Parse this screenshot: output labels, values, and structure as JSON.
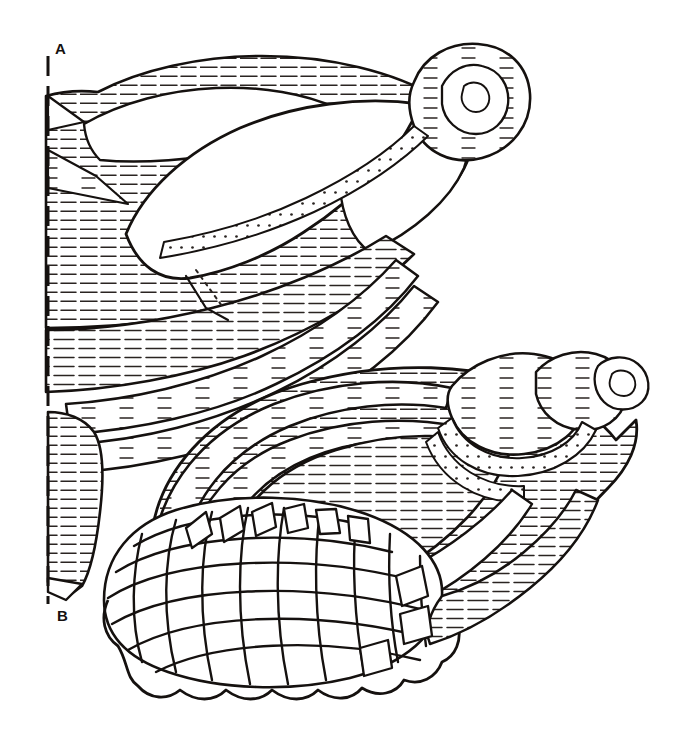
{
  "figure": {
    "background_color": "#ffffff",
    "ink_color": "#15110f",
    "hatch_color": "#2a2421",
    "width": 692,
    "height": 752
  },
  "axis": {
    "name": "reference-axis",
    "orientation": "vertical",
    "style": "dashed",
    "x": 48,
    "y_top": 56,
    "y_bottom": 604,
    "dash_length": 20,
    "gap_length": 10,
    "stroke_width": 3,
    "top_label": "A",
    "bottom_label": "B",
    "top_label_position": {
      "x": 55,
      "y": 41
    },
    "bottom_label_position": {
      "x": 57,
      "y": 608
    }
  },
  "specimens": [
    {
      "id": "upper-shell",
      "name": "upper-shell",
      "label": "A",
      "position": "upper-left",
      "orientation": "apex to upper right, siphonal canal to lower left",
      "apex": {
        "x": 470,
        "y": 78
      },
      "bounds": {
        "x": 40,
        "y": 45,
        "width": 505,
        "height": 545
      },
      "features": [
        "spiral apex with nested whorls",
        "broad body whorl with dense horizontal hatching",
        "two smooth unhatched shoulder panels",
        "long tapering siphonal canal extending to lower left",
        "beaded suture bands",
        "cut-away section along the dashed axis"
      ],
      "hatch_direction": "horizontal",
      "hatch_spacing_px": 9
    },
    {
      "id": "lower-shell",
      "name": "lower-shell",
      "label": "B",
      "position": "lower-right",
      "orientation": "apex to upper right, aperture lip to lower left",
      "apex": {
        "x": 646,
        "y": 383
      },
      "bounds": {
        "x": 95,
        "y": 345,
        "width": 565,
        "height": 350
      },
      "features": [
        "beaded spire whorls at apex",
        "arched hatched body whorl bands",
        "cancellate lattice net sculpture on the lower half",
        "scalloped crenulate basal margin",
        "radial rib panels fanning from the lattice",
        "beaded suture cords"
      ],
      "hatch_direction": "horizontal",
      "hatch_spacing_px": 9,
      "lattice": {
        "name": "cancellate-lattice",
        "spiral_cords": 7,
        "axial_ribs": 11,
        "cell_shape": "rounded quadrangular"
      }
    }
  ]
}
